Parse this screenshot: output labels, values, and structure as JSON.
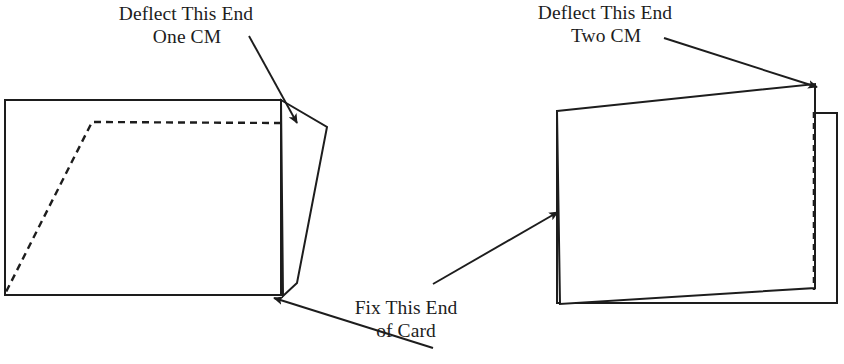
{
  "figure": {
    "title_not_shown": "",
    "labels": {
      "left_deflect": {
        "line1": "Deflect This End",
        "line2": "One CM"
      },
      "right_deflect": {
        "line1": "Deflect This End",
        "line2": "Two CM"
      },
      "fix_end": {
        "line1": "Fix This End",
        "line2": "of Card"
      }
    },
    "colors": {
      "stroke": "#1d1d1d",
      "background": "#ffffff",
      "text": "#1d1d1d"
    },
    "left_diagram": {
      "undeflected_card": {
        "shape": "rectangle",
        "style": "solid",
        "points": "5,100 281,100 281,295 5,295"
      },
      "deflected_card": {
        "shape": "quadrilateral",
        "style": "solid",
        "points": "281,100 327,127 297,283 283,296"
      },
      "deflection_guide": {
        "shape": "polyline",
        "style": "dashed",
        "points": "281,123 92,122 5,294"
      }
    },
    "right_diagram": {
      "undeflected_card": {
        "shape": "rectangle",
        "style": "solid",
        "points": "557,113 837,113 837,303 557,303"
      },
      "deflected_card": {
        "shape": "quadrilateral",
        "style": "solid",
        "points": "557,111 815,84 815,288 560,304"
      },
      "deflection_guide": {
        "shape": "line",
        "style": "dashed",
        "points": "814,112 814,290"
      }
    },
    "arrows": [
      {
        "name": "arrow-left-deflect",
        "from": [
          249,
          36
        ],
        "to": [
          299,
          126
        ]
      },
      {
        "name": "arrow-fix-end",
        "from": [
          433,
          348
        ],
        "to": [
          272,
          297
        ]
      },
      {
        "name": "arrow-right-deflect",
        "from": [
          664,
          38
        ],
        "to": [
          819,
          88
        ]
      },
      {
        "name": "arrow-right-fix-end",
        "from": [
          433,
          284
        ],
        "to": [
          560,
          211
        ]
      }
    ]
  }
}
